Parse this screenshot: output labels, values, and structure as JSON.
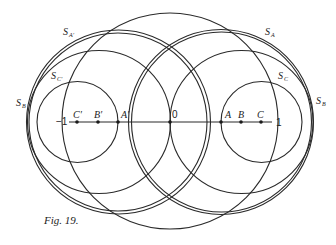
{
  "figure": {
    "caption": "Fig. 19.",
    "stroke_color": "#2a2a2a",
    "axis": {
      "left_label": "−1",
      "origin_label": "0",
      "right_label": "1"
    },
    "points": [
      {
        "name": "C'",
        "label": "C′"
      },
      {
        "name": "B'",
        "label": "B′"
      },
      {
        "name": "A'",
        "label": "A′"
      },
      {
        "name": "A",
        "label": "A"
      },
      {
        "name": "B",
        "label": "B"
      },
      {
        "name": "C",
        "label": "C"
      }
    ],
    "circle_labels": {
      "s_a_prime": "S",
      "s_a_prime_sub": "A′",
      "s_a": "S",
      "s_a_sub": "A",
      "s_c_prime": "S",
      "s_c_prime_sub": "C′",
      "s_c": "S",
      "s_c_sub": "C",
      "s_b_left": "S",
      "s_b_left_sub": "B",
      "s_b_right": "S",
      "s_b_right_sub": "B"
    }
  }
}
